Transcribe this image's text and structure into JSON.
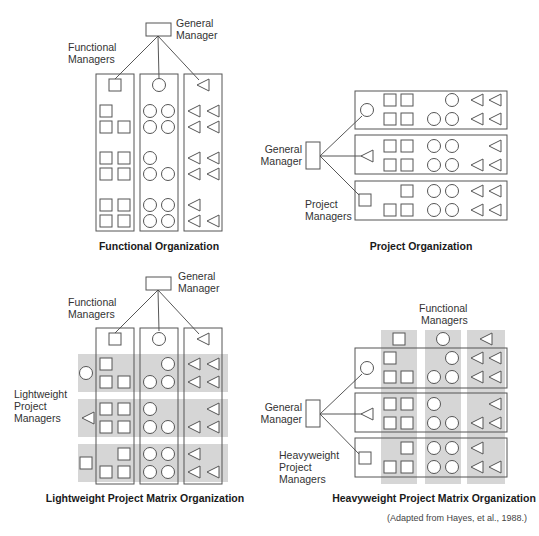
{
  "colors": {
    "line": "#555555",
    "band": "#d6d6d6",
    "text": "#333333",
    "background": "#ffffff"
  },
  "functional": {
    "caption": "Functional Organization",
    "general_manager_label": [
      "General",
      "Manager"
    ],
    "functional_managers_label": [
      "Functional",
      "Managers"
    ],
    "columns": [
      {
        "manager": "square",
        "rows": [
          [
            1,
            0
          ],
          [
            1,
            1
          ],
          [
            1,
            1
          ],
          [
            1,
            1
          ],
          [
            1,
            1
          ],
          [
            1,
            1
          ]
        ]
      },
      {
        "manager": "circle",
        "rows": [
          [
            1,
            1
          ],
          [
            1,
            1
          ],
          [
            1,
            0
          ],
          [
            1,
            1
          ],
          [
            1,
            1
          ],
          [
            1,
            1
          ]
        ]
      },
      {
        "manager": "triangle",
        "rows": [
          [
            1,
            1
          ],
          [
            1,
            1
          ],
          [
            1,
            1
          ],
          [
            1,
            1
          ],
          [
            1,
            0
          ],
          [
            1,
            1
          ]
        ]
      }
    ]
  },
  "project": {
    "caption": "Project Organization",
    "general_manager_label": [
      "General",
      "Manager"
    ],
    "project_managers_label": [
      "Project",
      "Managers"
    ],
    "projects": [
      {
        "manager": "circle",
        "squares": [
          [
            1,
            1
          ],
          [
            1,
            1
          ]
        ],
        "circles": [
          [
            0,
            1
          ],
          [
            1,
            1
          ]
        ],
        "triangles": [
          [
            1,
            1
          ],
          [
            1,
            1
          ]
        ]
      },
      {
        "manager": "triangle",
        "squares": [
          [
            1,
            1
          ],
          [
            1,
            1
          ]
        ],
        "circles": [
          [
            1,
            1
          ],
          [
            1,
            1
          ]
        ],
        "triangles": [
          [
            0,
            1
          ],
          [
            1,
            1
          ]
        ]
      },
      {
        "manager": "square",
        "squares": [
          [
            0,
            1
          ],
          [
            1,
            1
          ]
        ],
        "circles": [
          [
            1,
            1
          ],
          [
            1,
            1
          ]
        ],
        "triangles": [
          [
            1,
            1
          ],
          [
            1,
            1
          ]
        ]
      }
    ]
  },
  "lightweight": {
    "caption": "Lightweight Project Matrix Organization",
    "general_manager_label": [
      "General",
      "Manager"
    ],
    "functional_managers_label": [
      "Functional",
      "Managers"
    ],
    "project_managers_label": [
      "Lightweight",
      "Project",
      "Managers"
    ],
    "project_manager_shapes": [
      "circle",
      "triangle",
      "square"
    ]
  },
  "heavyweight": {
    "caption": "Heavyweight Project Matrix Organization",
    "general_manager_label": [
      "General",
      "Manager"
    ],
    "functional_managers_label": [
      "Functional",
      "Managers"
    ],
    "project_managers_label": [
      "Heavyweight",
      "Project",
      "Managers"
    ],
    "project_manager_shapes": [
      "circle",
      "triangle",
      "square"
    ]
  },
  "citation": "(Adapted from Hayes, et al., 1988.)"
}
